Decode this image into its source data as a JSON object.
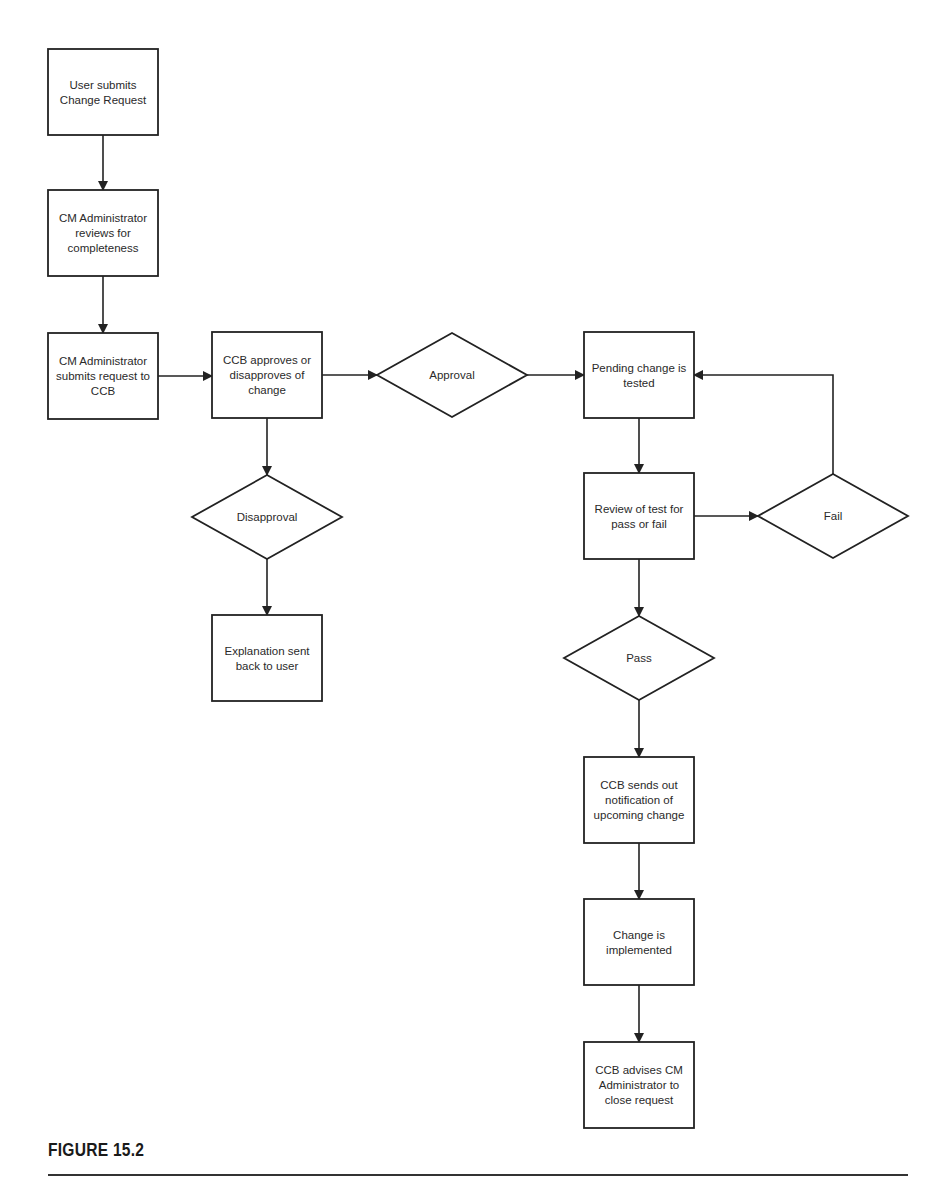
{
  "figure": {
    "caption": "FIGURE 15.2"
  },
  "nodes": [
    {
      "id": "submit",
      "type": "process",
      "lines": [
        "User submits",
        "Change Request"
      ]
    },
    {
      "id": "review",
      "type": "process",
      "lines": [
        "CM Administrator",
        "reviews  for",
        "completeness"
      ]
    },
    {
      "id": "forward",
      "type": "process",
      "lines": [
        "CM Administrator",
        "submits request to",
        "CCB"
      ]
    },
    {
      "id": "ccb",
      "type": "process",
      "lines": [
        "CCB approves or",
        "disapproves of",
        "change"
      ]
    },
    {
      "id": "approval",
      "type": "decision",
      "lines": [
        "Approval"
      ]
    },
    {
      "id": "test",
      "type": "process",
      "lines": [
        "Pending change is",
        "tested"
      ]
    },
    {
      "id": "disapproval",
      "type": "decision",
      "lines": [
        "Disapproval"
      ]
    },
    {
      "id": "explain",
      "type": "process",
      "lines": [
        "Explanation sent",
        "back to user"
      ]
    },
    {
      "id": "reviewtest",
      "type": "process",
      "lines": [
        "Review of test for",
        "pass or fail"
      ]
    },
    {
      "id": "fail",
      "type": "decision",
      "lines": [
        "Fail"
      ]
    },
    {
      "id": "pass",
      "type": "decision",
      "lines": [
        "Pass"
      ]
    },
    {
      "id": "notify",
      "type": "process",
      "lines": [
        "CCB sends out",
        "notification of",
        "upcoming change"
      ]
    },
    {
      "id": "implement",
      "type": "process",
      "lines": [
        "Change is",
        "implemented"
      ]
    },
    {
      "id": "close",
      "type": "process",
      "lines": [
        "CCB advises CM",
        "Administrator to",
        "close request"
      ]
    }
  ],
  "edges": [
    {
      "from": "submit",
      "to": "review"
    },
    {
      "from": "review",
      "to": "forward"
    },
    {
      "from": "forward",
      "to": "ccb"
    },
    {
      "from": "ccb",
      "to": "approval"
    },
    {
      "from": "approval",
      "to": "test"
    },
    {
      "from": "ccb",
      "to": "disapproval"
    },
    {
      "from": "disapproval",
      "to": "explain"
    },
    {
      "from": "test",
      "to": "reviewtest"
    },
    {
      "from": "reviewtest",
      "to": "fail"
    },
    {
      "from": "fail",
      "to": "test"
    },
    {
      "from": "reviewtest",
      "to": "pass"
    },
    {
      "from": "pass",
      "to": "notify"
    },
    {
      "from": "notify",
      "to": "implement"
    },
    {
      "from": "implement",
      "to": "close"
    }
  ]
}
